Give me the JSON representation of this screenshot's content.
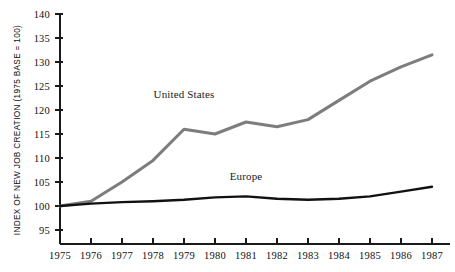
{
  "chart_data": {
    "type": "line",
    "title": "",
    "xlabel": "",
    "ylabel": "INDEX OF NEW JOB CREATION (1975 BASE = 100)",
    "categories": [
      "1975",
      "1976",
      "1977",
      "1978",
      "1979",
      "1980",
      "1981",
      "1982",
      "1983",
      "1984",
      "1985",
      "1986",
      "1987"
    ],
    "x": [
      1975,
      1976,
      1977,
      1978,
      1979,
      1980,
      1981,
      1982,
      1983,
      1984,
      1985,
      1986,
      1987
    ],
    "xlim": [
      1975,
      1987
    ],
    "ylim": [
      95,
      140
    ],
    "yticks": [
      95,
      100,
      105,
      110,
      115,
      120,
      125,
      130,
      135,
      140
    ],
    "xticks": [
      "1975",
      "1976",
      "1977",
      "1978",
      "1979",
      "1980",
      "1981",
      "1982",
      "1983",
      "1984",
      "1985",
      "1986",
      "1987"
    ],
    "grid": false,
    "legend": "inline-annotations",
    "series": [
      {
        "name": "United States",
        "color": "#7d7d7d",
        "linewidth": 3.0,
        "values": [
          100,
          101,
          105,
          109.5,
          116,
          115,
          117.5,
          116.5,
          118,
          122,
          126,
          129,
          131.5
        ],
        "label_x": 1979,
        "label_y": 122.5
      },
      {
        "name": "Europe",
        "color": "#111111",
        "linewidth": 2.4,
        "values": [
          100,
          100.5,
          100.8,
          101,
          101.3,
          101.8,
          102,
          101.5,
          101.3,
          101.5,
          102,
          103,
          104
        ],
        "label_x": 1981,
        "label_y": 105.5
      }
    ],
    "annotations": [
      {
        "text": "United States",
        "x": 1979,
        "y": 122.5
      },
      {
        "text": "Europe",
        "x": 1981,
        "y": 105.5
      }
    ]
  },
  "axes": {
    "y_title": "INDEX OF NEW JOB CREATION (1975 BASE = 100)",
    "y_tick_labels": [
      "140",
      "135",
      "130",
      "125",
      "120",
      "115",
      "110",
      "105",
      "100",
      "95"
    ],
    "x_tick_labels": [
      "1975",
      "1976",
      "1977",
      "1978",
      "1979",
      "1980",
      "1981",
      "1982",
      "1983",
      "1984",
      "1985",
      "1986",
      "1987"
    ]
  },
  "colors": {
    "background": "#ffffff",
    "axis": "#1a1a1a",
    "united_states": "#7d7d7d",
    "europe": "#111111"
  }
}
